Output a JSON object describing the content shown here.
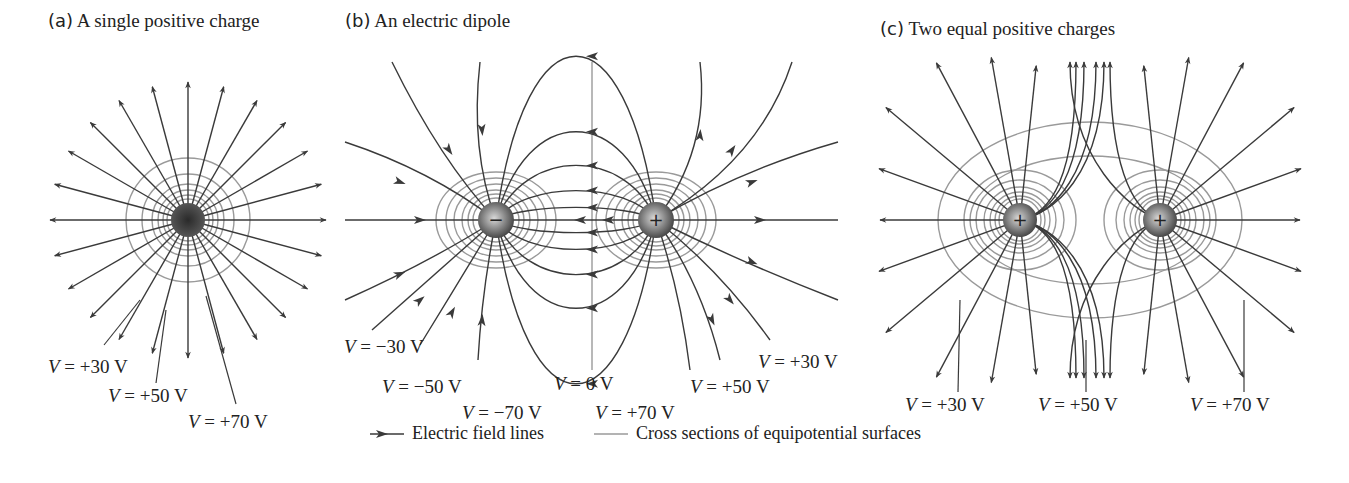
{
  "panels": [
    {
      "id": "a",
      "tag": "(a)",
      "title": "A single positive charge",
      "title_x": 48,
      "charges": [
        {
          "x": 188,
          "y": 220,
          "sign": "+"
        }
      ],
      "equipotential_labels": [
        {
          "text_v": "V",
          "text_rest": " =  +30 V",
          "x": 48,
          "y": 357
        },
        {
          "text_v": "V",
          "text_rest": " =  +50 V",
          "x": 108,
          "y": 386
        },
        {
          "text_v": "V",
          "text_rest": " =  +70 V",
          "x": 188,
          "y": 412
        }
      ]
    },
    {
      "id": "b",
      "tag": "(b)",
      "title": "An electric dipole",
      "title_x": 345,
      "charges": [
        {
          "x": 496,
          "y": 220,
          "sign": "−"
        },
        {
          "x": 656,
          "y": 220,
          "sign": "+"
        }
      ],
      "equipotential_labels": [
        {
          "text_v": "V",
          "text_rest": " = −30 V",
          "x": 344,
          "y": 337
        },
        {
          "text_v": "V",
          "text_rest": " = −50 V",
          "x": 382,
          "y": 377
        },
        {
          "text_v": "V",
          "text_rest": " = 0 V",
          "x": 554,
          "y": 374
        },
        {
          "text_v": "V",
          "text_rest": " = −70 V",
          "x": 462,
          "y": 403
        },
        {
          "text_v": "V",
          "text_rest": " = +70 V",
          "x": 595,
          "y": 403
        },
        {
          "text_v": "V",
          "text_rest": " = +50 V",
          "x": 690,
          "y": 377
        },
        {
          "text_v": "V",
          "text_rest": " = +30 V",
          "x": 758,
          "y": 352
        }
      ]
    },
    {
      "id": "c",
      "tag": "(c)",
      "title": "Two equal positive charges",
      "title_x": 880,
      "charges": [
        {
          "x": 1020,
          "y": 220,
          "sign": "+"
        },
        {
          "x": 1160,
          "y": 220,
          "sign": "+"
        }
      ],
      "equipotential_labels": [
        {
          "text_v": "V",
          "text_rest": " =  +30 V",
          "x": 905,
          "y": 395
        },
        {
          "text_v": "V",
          "text_rest": " =  +50 V",
          "x": 1038,
          "y": 395
        },
        {
          "text_v": "V",
          "text_rest": " =  +70 V",
          "x": 1190,
          "y": 395
        }
      ]
    }
  ],
  "legend": {
    "field_lines_label": "Electric field lines",
    "equipotential_label": "Cross sections of equipotential surfaces"
  },
  "colors": {
    "field_line": "#3a3a3a",
    "equipotential": "#9a9a9a",
    "charge_dark": "#3c3c3c",
    "charge_light": "#d8d8d8",
    "background": "#ffffff"
  }
}
